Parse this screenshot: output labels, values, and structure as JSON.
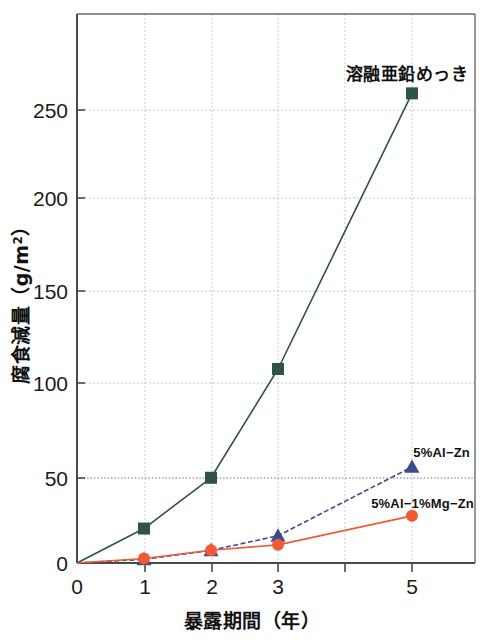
{
  "chart_data": {
    "type": "line",
    "title": "",
    "xlabel": "暴露期間（年）",
    "ylabel": "腐食減量（g/m2）",
    "ylabel_main": "腐食減量",
    "ylabel_unit_open": "（g/m",
    "ylabel_unit_exp": "2",
    "ylabel_unit_close": "）",
    "x": [
      0,
      1,
      2,
      3,
      5
    ],
    "xlim": [
      0,
      5.9
    ],
    "ylim": [
      0,
      297
    ],
    "xticks": [
      0,
      1,
      2,
      3,
      4,
      5
    ],
    "xtick_labels": [
      "0",
      "1",
      "2",
      "3",
      "",
      "5"
    ],
    "yticks": [
      0,
      50,
      100,
      150,
      200,
      250
    ],
    "ytick_labels": [
      "0",
      "50",
      "100",
      "150",
      "200",
      "250"
    ],
    "grid": true,
    "grid_style": "dotted",
    "legend_position": "inline-annotations",
    "series": [
      {
        "name": "溶融亜鉛めっき",
        "label": "溶融亜鉛めっき",
        "color": "#2f5446",
        "marker": "square",
        "x": [
          0,
          1,
          2,
          3,
          5
        ],
        "values": [
          0,
          19,
          47,
          107,
          259
        ],
        "label_x": 5,
        "label_y": 283
      },
      {
        "name": "5%Al-Zn",
        "label": "5%Al−Zn",
        "color": "#3a4a8c",
        "marker": "triangle",
        "x": [
          0,
          1,
          2,
          3,
          5
        ],
        "values": [
          0,
          2,
          7,
          15,
          53
        ],
        "label_x": 5,
        "label_y": 66
      },
      {
        "name": "5%Al-1%Mg-Zn",
        "label": "5%Al−1%Mg−Zn",
        "color": "#f05a35",
        "marker": "circle",
        "x": [
          0,
          1,
          2,
          3,
          5
        ],
        "values": [
          0,
          2.5,
          7,
          10,
          26
        ],
        "label_x": 5,
        "label_y": 37
      }
    ]
  },
  "axis": {
    "xtick_0": "0",
    "xtick_1": "1",
    "xtick_2": "2",
    "xtick_3": "3",
    "xtick_5": "5",
    "ytick_0": "0",
    "ytick_50": "50",
    "ytick_100": "100",
    "ytick_150": "150",
    "ytick_200": "200",
    "ytick_250": "250"
  },
  "labels": {
    "series_green": "溶融亜鉛めっき",
    "series_blue": "5%Al−Zn",
    "series_red": "5%Al−1%Mg−Zn",
    "xaxis_title": "暴露期間（年）",
    "yaxis_title_main": "腐食減量",
    "yaxis_unit_prefix": "（g/m",
    "yaxis_unit_exp": "2",
    "yaxis_unit_suffix": "）"
  },
  "colors": {
    "green": "#2f5446",
    "blue": "#3a4a8c",
    "red": "#f05a35",
    "axis": "#5a5a5a",
    "grid": "#b9b9b9",
    "text": "#111111",
    "background": "#ffffff"
  }
}
